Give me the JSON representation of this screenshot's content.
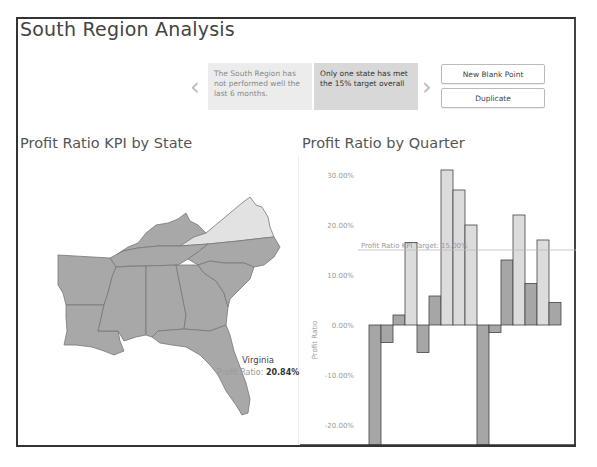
{
  "dashboard": {
    "title": "South Region Analysis"
  },
  "story": {
    "prev_icon": "chevron-left-icon",
    "next_icon": "chevron-right-icon",
    "points": [
      {
        "text": "The South Region has not performed well the last 6 months.",
        "active": false
      },
      {
        "text": "Only one state has met the 15% target overall",
        "active": true
      }
    ],
    "buttons": {
      "new_blank_point": "New Blank Point",
      "duplicate": "Duplicate"
    }
  },
  "map_panel": {
    "title": "Profit Ratio KPI by State",
    "tooltip": {
      "state": "Virginia",
      "label": "Profit Ratio:",
      "value": "20.84%"
    },
    "colors": {
      "below_target": "#a8a8a8",
      "above_target": "#e2e2e2",
      "border": "#777777"
    },
    "highlighted_state": "Virginia"
  },
  "chart_panel": {
    "title": "Profit Ratio by Quarter"
  },
  "chart_data": {
    "type": "bar",
    "title": "Profit Ratio by Quarter",
    "xlabel": "",
    "ylabel": "Profit Ratio",
    "ylim": [
      -24,
      32
    ],
    "y_ticks": [
      "30.00%",
      "20.00%",
      "10.00%",
      "0.00%",
      "-10.00%",
      "-20.00%"
    ],
    "y_tick_values": [
      30,
      20,
      10,
      0,
      -10,
      -20
    ],
    "reference_line": {
      "label": "Profit Ratio KPI Target: 15.00%",
      "value": 15
    },
    "grid": false,
    "colors": {
      "below_target": "#a6a6a6",
      "above_target": "#dcdcdc",
      "outline": "#444444"
    },
    "values": [
      -25,
      -3.5,
      2,
      16.5,
      -5.5,
      5.8,
      31,
      27,
      20,
      -25,
      -1.5,
      13,
      22,
      8.3,
      17,
      4.5
    ],
    "meets_target": [
      false,
      false,
      false,
      true,
      false,
      false,
      true,
      true,
      true,
      false,
      false,
      false,
      true,
      false,
      true,
      false
    ]
  }
}
